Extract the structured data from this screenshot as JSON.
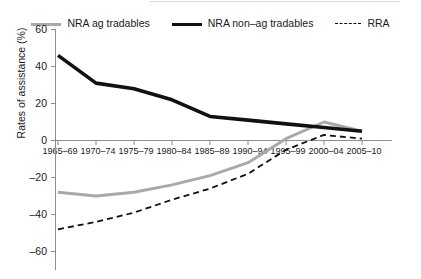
{
  "legend": {
    "entries": [
      {
        "label": "NRA ag tradables",
        "style": "solid",
        "color": "#a9a9a9",
        "icon": "line-swatch-gray"
      },
      {
        "label": "NRA non–ag tradables",
        "style": "solid",
        "color": "#111111",
        "icon": "line-swatch-black"
      },
      {
        "label": "RRA",
        "style": "dashed",
        "color": "#111111",
        "icon": "line-swatch-dashed"
      }
    ]
  },
  "axes": {
    "ylabel": "Rates of assistance (%)",
    "yticks": [
      "60",
      "40",
      "20",
      "0",
      "–20",
      "–40",
      "–60"
    ],
    "xticks": [
      "1965–69",
      "1970–74",
      "1975–79",
      "1980–84",
      "1985–89",
      "1990–94",
      "1995–99",
      "2000–04",
      "2005–10"
    ]
  },
  "chart_data": {
    "type": "line",
    "title": "",
    "xlabel": "",
    "ylabel": "Rates of assistance (%)",
    "categories": [
      "1965–69",
      "1970–74",
      "1975–79",
      "1980–84",
      "1985–89",
      "1990–94",
      "1995–99",
      "2000–04",
      "2005–10"
    ],
    "ylim": [
      -60,
      60
    ],
    "ytick_values": [
      60,
      40,
      20,
      0,
      -20,
      -40,
      -60
    ],
    "grid": false,
    "legend_position": "top",
    "series": [
      {
        "name": "NRA ag tradables",
        "color": "#a9a9a9",
        "style": "solid",
        "width": 3,
        "values": [
          -28,
          -30,
          -28,
          -24,
          -19,
          -12,
          1,
          10,
          5
        ]
      },
      {
        "name": "NRA non–ag tradables",
        "color": "#111111",
        "style": "solid",
        "width": 3.6,
        "values": [
          46,
          31,
          28,
          22,
          13,
          11,
          9,
          7,
          5
        ]
      },
      {
        "name": "RRA",
        "color": "#111111",
        "style": "dashed",
        "width": 1.8,
        "values": [
          -48,
          -44,
          -39,
          -32,
          -26,
          -18,
          -5,
          3,
          1
        ]
      }
    ]
  }
}
